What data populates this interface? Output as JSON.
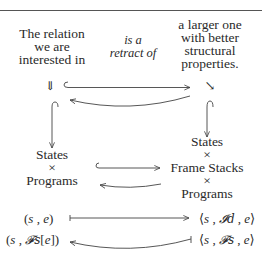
{
  "diagram": {
    "top_left": {
      "lines": [
        "The relation",
        "we are",
        "interested in"
      ]
    },
    "top_middle": {
      "lines": [
        "is a",
        "retract of"
      ]
    },
    "top_right": {
      "lines": [
        "a larger one",
        "with better",
        "structural",
        "properties."
      ]
    },
    "left_arrow_symbol": "⇓",
    "right_arrow_symbol": "↘",
    "middle_left": {
      "lines": [
        "States",
        "×",
        "Programs"
      ]
    },
    "middle_right": {
      "lines": [
        "States",
        "×",
        "Frame Stacks",
        "×",
        "Programs"
      ]
    },
    "formula_row1": {
      "left": {
        "open": "(",
        "s": "s",
        "sep": " , ",
        "e": "e",
        "close": ")"
      },
      "right": {
        "open": "⟨",
        "s": "s",
        "sep1": " , ",
        "frame": "𝓘d",
        "sep2": " , ",
        "e": "e",
        "close": "⟩"
      },
      "arrow": "maps-to"
    },
    "formula_row2": {
      "left": {
        "open": "(",
        "s": "s",
        "sep": " , ",
        "frame": "𝓕s",
        "bracket_open": "[",
        "e": "e",
        "bracket_close": "]",
        "close": ")"
      },
      "right": {
        "open": "⟨",
        "s": "s",
        "sep1": " , ",
        "frame": "𝓕s",
        "sep2": " , ",
        "e": "e",
        "close": "⟩"
      },
      "arrow": "maps-from-curved"
    },
    "arrows": [
      {
        "name": "top-injection",
        "type": "hook-right"
      },
      {
        "name": "top-retraction",
        "type": "curved-left"
      },
      {
        "name": "left-vertical-injection",
        "type": "hook-down"
      },
      {
        "name": "right-vertical-injection",
        "type": "hook-down"
      },
      {
        "name": "middle-injection",
        "type": "hook-right"
      },
      {
        "name": "middle-retraction",
        "type": "curved-left"
      },
      {
        "name": "row1-mapsto",
        "type": "mapsto-right"
      },
      {
        "name": "row2-mapsfrom",
        "type": "mapsto-left-curved"
      }
    ]
  }
}
